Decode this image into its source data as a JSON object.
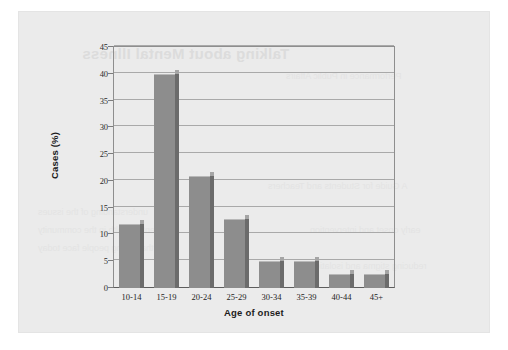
{
  "page": {
    "panel_color": "#ebebeb",
    "background_color": "#ffffff"
  },
  "bleed_through": {
    "title": "Talking about Mental Illness",
    "lines": [
      "Performance in Public Affairs",
      "A Guide for Students and Teachers",
      "understanding of the issues",
      "mental health in the community",
      "that young people face today",
      "early onset and intervention",
      "reducing stigma and isolation"
    ]
  },
  "chart_data": {
    "type": "bar",
    "title": "",
    "xlabel": "Age of onset",
    "ylabel": "Cases (%)",
    "categories": [
      "10-14",
      "15-19",
      "20-24",
      "25-29",
      "30-34",
      "35-39",
      "40-44",
      "45+"
    ],
    "values": [
      12,
      40,
      21,
      12.8,
      5,
      5,
      2.7,
      2.7
    ],
    "yticks": [
      0,
      5,
      10,
      15,
      20,
      25,
      30,
      35,
      40,
      45
    ],
    "ytick_labels": [
      "0",
      "5",
      "10",
      "15",
      "20",
      "25",
      "30",
      "35",
      "40",
      "45"
    ],
    "ylim": [
      0,
      45
    ],
    "grid": true,
    "legend": "none",
    "bar_color": "#8d8d8d",
    "bar_shadow_color": "#6b6b6b",
    "gridline_color": "#a9a9a9",
    "axis_color": "#5d5d5d"
  }
}
